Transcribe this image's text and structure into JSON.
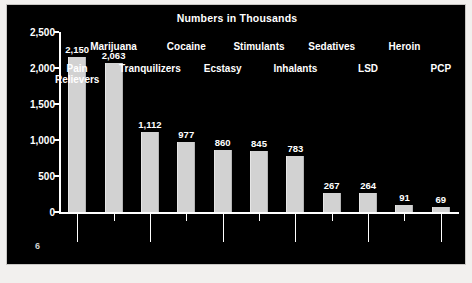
{
  "page": {
    "number": "6"
  },
  "chart_data": {
    "type": "bar",
    "title": "Numbers in Thousands",
    "xlabel": "",
    "ylabel": "",
    "ylim": [
      0,
      2500
    ],
    "yticks": [
      0,
      500,
      1000,
      1500,
      2000,
      2500
    ],
    "ytick_labels": [
      "0",
      "500",
      "1,000",
      "1,500",
      "2,000",
      "2,500"
    ],
    "grid": false,
    "legend": null,
    "categories": [
      "Pain Relievers",
      "Marijuana",
      "Tranquilizers",
      "Cocaine",
      "Ecstasy",
      "Stimulants",
      "Inhalants",
      "Sedatives",
      "LSD",
      "Heroin",
      "PCP"
    ],
    "category_rows": [
      1,
      0,
      1,
      0,
      1,
      0,
      1,
      0,
      1,
      0,
      1
    ],
    "values": [
      2150,
      2063,
      1112,
      977,
      860,
      845,
      783,
      267,
      264,
      91,
      69
    ],
    "value_labels": [
      "2,150",
      "2,063",
      "1,112",
      "977",
      "860",
      "845",
      "783",
      "267",
      "264",
      "91",
      "69"
    ],
    "colors": {
      "background": "#000000",
      "bar": "#d2d2d2",
      "text": "#ffffff",
      "axis": "#ffffff"
    }
  }
}
